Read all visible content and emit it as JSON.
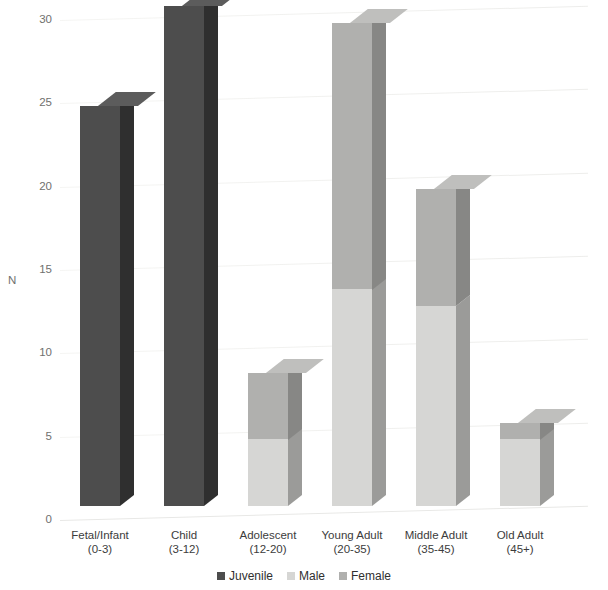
{
  "chart_data": {
    "type": "bar",
    "subtype": "stacked-3d-column",
    "title": "",
    "xlabel": "",
    "ylabel": "N",
    "ylim": [
      0,
      30
    ],
    "yticks": [
      0,
      5,
      10,
      15,
      20,
      25,
      30
    ],
    "grid": true,
    "legend_position": "bottom-center",
    "categories": [
      "Fetal/Infant",
      "Child",
      "Adolescent",
      "Young Adult",
      "Middle Adult",
      "Old Adult"
    ],
    "category_sublabels": [
      "(0-3)",
      "(3-12)",
      "(12-20)",
      "(20-35)",
      "(35-45)",
      "(45+)"
    ],
    "series": [
      {
        "name": "Juvenile",
        "color": "#4d4d4d",
        "values": [
          24,
          30,
          0,
          0,
          0,
          0
        ]
      },
      {
        "name": "Male",
        "color": "#d6d6d4",
        "values": [
          0,
          0,
          4,
          13,
          12,
          4
        ]
      },
      {
        "name": "Female",
        "color": "#b0b0ae",
        "values": [
          0,
          0,
          4,
          16,
          7,
          1
        ]
      }
    ],
    "totals": [
      24,
      30,
      8,
      29,
      19,
      5
    ]
  },
  "legend": {
    "items": [
      {
        "label": "Juvenile",
        "color": "#4d4d4d"
      },
      {
        "label": "Male",
        "color": "#d6d6d4"
      },
      {
        "label": "Female",
        "color": "#b0b0ae"
      }
    ]
  },
  "axis": {
    "y_title": "N",
    "y_tick_labels": [
      "30",
      "25",
      "20",
      "15",
      "10",
      "5",
      "0"
    ]
  },
  "colors": {
    "background": "#ffffff",
    "gridline": "#f0f0ee",
    "tick_text": "#70706e",
    "label_text": "#3c3c3c",
    "juvenile_front": "#4d4d4d",
    "juvenile_side": "#2f2f2f",
    "juvenile_top": "#5c5c5c",
    "male_front": "#d6d6d4",
    "male_side": "#9b9b99",
    "male_top": "#e2e2e0",
    "female_front": "#b0b0ae",
    "female_side": "#878785",
    "female_top": "#bfbfbd"
  }
}
